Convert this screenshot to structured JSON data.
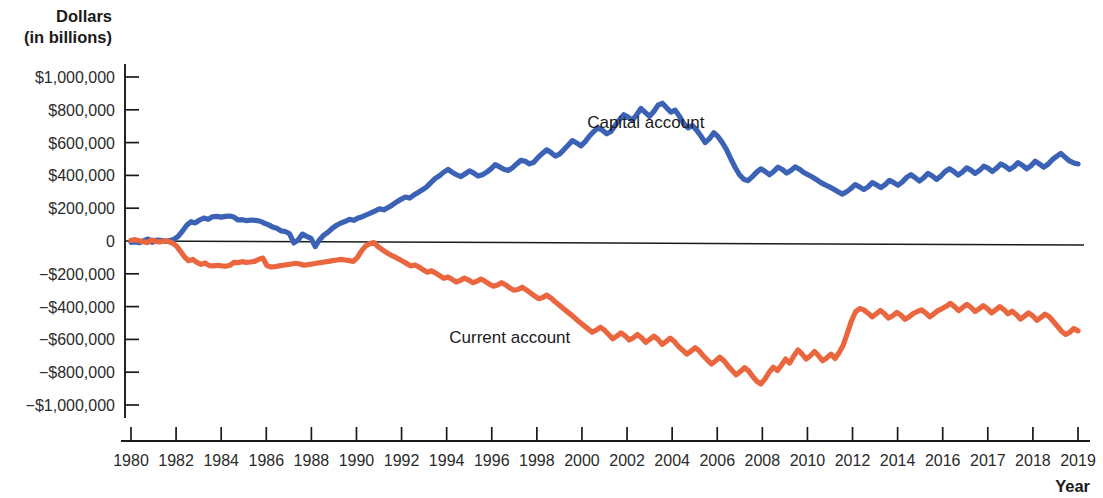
{
  "chart_data": {
    "type": "line",
    "title": "",
    "xlabel": "Year",
    "ylabel": "Dollars (in billions)",
    "ylabel_line1": "Dollars",
    "ylabel_line2": "(in billions)",
    "ylim": [
      -1000000,
      1000000
    ],
    "xlim": [
      1980,
      2019
    ],
    "grid": false,
    "legend_position": "inline-annotation",
    "y_ticks": [
      1000000,
      800000,
      600000,
      400000,
      200000,
      0,
      -200000,
      -400000,
      -600000,
      -800000,
      -1000000
    ],
    "y_tick_labels": [
      "$1,000,000",
      "$800,000",
      "$600,000",
      "$400,000",
      "$200,000",
      "0",
      "−$200,000",
      "−$400,000",
      "−$600,000",
      "−$800,000",
      "−$1,000,000"
    ],
    "x_tick_labels": [
      "1980",
      "1982",
      "1984",
      "1986",
      "1988",
      "1990",
      "1992",
      "1994",
      "1996",
      "1998",
      "2000",
      "2002",
      "2004",
      "2006",
      "2008",
      "2010",
      "2012",
      "2014",
      "2016",
      "2017",
      "2018",
      "2019"
    ],
    "colors": {
      "capital_account": "#3C62B6",
      "current_account": "#E9663F",
      "axis": "#1a1a1a",
      "text": "#1a1a1a"
    },
    "series": [
      {
        "name": "Capital account",
        "color": "#3C62B6",
        "label_x": 2001.2,
        "label_y": 690000,
        "values": [
          -8000,
          -6000,
          -10000,
          2000,
          12000,
          -8000,
          6000,
          4000,
          -2000,
          2000,
          10000,
          28000,
          60000,
          96000,
          118000,
          110000,
          128000,
          140000,
          132000,
          148000,
          150000,
          146000,
          150000,
          152000,
          146000,
          128000,
          130000,
          124000,
          128000,
          126000,
          122000,
          110000,
          100000,
          86000,
          78000,
          62000,
          58000,
          44000,
          -12000,
          6000,
          42000,
          28000,
          16000,
          -34000,
          8000,
          36000,
          54000,
          78000,
          96000,
          110000,
          120000,
          132000,
          126000,
          140000,
          148000,
          160000,
          172000,
          184000,
          196000,
          190000,
          204000,
          220000,
          238000,
          254000,
          268000,
          262000,
          280000,
          296000,
          312000,
          330000,
          356000,
          382000,
          398000,
          420000,
          436000,
          418000,
          404000,
          392000,
          410000,
          428000,
          414000,
          396000,
          404000,
          420000,
          440000,
          466000,
          452000,
          438000,
          430000,
          446000,
          470000,
          492000,
          486000,
          470000,
          480000,
          510000,
          534000,
          556000,
          540000,
          518000,
          530000,
          556000,
          584000,
          612000,
          598000,
          580000,
          606000,
          640000,
          668000,
          690000,
          676000,
          654000,
          668000,
          704000,
          740000,
          770000,
          756000,
          736000,
          770000,
          808000,
          784000,
          760000,
          790000,
          828000,
          840000,
          812000,
          786000,
          798000,
          760000,
          716000,
          690000,
          704000,
          676000,
          640000,
          600000,
          624000,
          660000,
          636000,
          600000,
          556000,
          500000,
          448000,
          404000,
          376000,
          368000,
          392000,
          420000,
          440000,
          424000,
          404000,
          424000,
          450000,
          436000,
          414000,
          430000,
          452000,
          438000,
          418000,
          404000,
          390000,
          374000,
          356000,
          342000,
          330000,
          316000,
          300000,
          286000,
          300000,
          320000,
          344000,
          330000,
          314000,
          330000,
          356000,
          342000,
          326000,
          344000,
          370000,
          356000,
          340000,
          360000,
          388000,
          404000,
          386000,
          366000,
          386000,
          412000,
          396000,
          376000,
          396000,
          424000,
          440000,
          424000,
          402000,
          420000,
          446000,
          432000,
          412000,
          430000,
          456000,
          444000,
          424000,
          444000,
          470000,
          456000,
          436000,
          452000,
          478000,
          462000,
          440000,
          458000,
          486000,
          470000,
          450000,
          468000,
          496000,
          516000,
          534000,
          510000,
          488000,
          476000,
          470000
        ]
      },
      {
        "name": "Current account",
        "color": "#E9663F",
        "label_x": 1995.6,
        "label_y": -620000,
        "values": [
          4000,
          8000,
          2000,
          -4000,
          -10000,
          6000,
          -2000,
          -6000,
          2000,
          -2000,
          -12000,
          -30000,
          -62000,
          -98000,
          -120000,
          -112000,
          -130000,
          -142000,
          -134000,
          -150000,
          -152000,
          -148000,
          -152000,
          -154000,
          -148000,
          -130000,
          -132000,
          -126000,
          -130000,
          -128000,
          -124000,
          -112000,
          -104000,
          -150000,
          -158000,
          -156000,
          -152000,
          -148000,
          -144000,
          -140000,
          -136000,
          -140000,
          -148000,
          -144000,
          -140000,
          -136000,
          -132000,
          -128000,
          -124000,
          -120000,
          -116000,
          -112000,
          -116000,
          -120000,
          -124000,
          -100000,
          -60000,
          -30000,
          -16000,
          -10000,
          -34000,
          -52000,
          -70000,
          -84000,
          -96000,
          -110000,
          -124000,
          -138000,
          -152000,
          -146000,
          -160000,
          -176000,
          -190000,
          -182000,
          -196000,
          -212000,
          -228000,
          -220000,
          -234000,
          -250000,
          -240000,
          -226000,
          -238000,
          -254000,
          -246000,
          -232000,
          -246000,
          -262000,
          -276000,
          -268000,
          -254000,
          -268000,
          -286000,
          -300000,
          -296000,
          -282000,
          -298000,
          -316000,
          -334000,
          -352000,
          -344000,
          -330000,
          -348000,
          -370000,
          -390000,
          -412000,
          -432000,
          -452000,
          -474000,
          -496000,
          -516000,
          -536000,
          -556000,
          -544000,
          -526000,
          -544000,
          -570000,
          -596000,
          -580000,
          -560000,
          -578000,
          -604000,
          -590000,
          -570000,
          -590000,
          -618000,
          -600000,
          -580000,
          -600000,
          -630000,
          -612000,
          -592000,
          -614000,
          -644000,
          -666000,
          -690000,
          -672000,
          -650000,
          -670000,
          -700000,
          -726000,
          -750000,
          -730000,
          -708000,
          -730000,
          -762000,
          -790000,
          -816000,
          -796000,
          -772000,
          -792000,
          -826000,
          -856000,
          -872000,
          -840000,
          -800000,
          -770000,
          -790000,
          -756000,
          -720000,
          -744000,
          -700000,
          -664000,
          -690000,
          -720000,
          -700000,
          -674000,
          -700000,
          -730000,
          -712000,
          -690000,
          -716000,
          -680000,
          -634000,
          -560000,
          -486000,
          -430000,
          -412000,
          -420000,
          -440000,
          -462000,
          -444000,
          -424000,
          -444000,
          -470000,
          -456000,
          -436000,
          -452000,
          -478000,
          -462000,
          -442000,
          -430000,
          -420000,
          -438000,
          -462000,
          -444000,
          -424000,
          -412000,
          -398000,
          -380000,
          -400000,
          -424000,
          -406000,
          -386000,
          -404000,
          -430000,
          -414000,
          -394000,
          -412000,
          -438000,
          -420000,
          -400000,
          -418000,
          -444000,
          -428000,
          -448000,
          -476000,
          -458000,
          -438000,
          -456000,
          -484000,
          -466000,
          -446000,
          -462000,
          -490000,
          -520000,
          -550000,
          -570000,
          -556000,
          -534000,
          -548000
        ]
      }
    ]
  }
}
